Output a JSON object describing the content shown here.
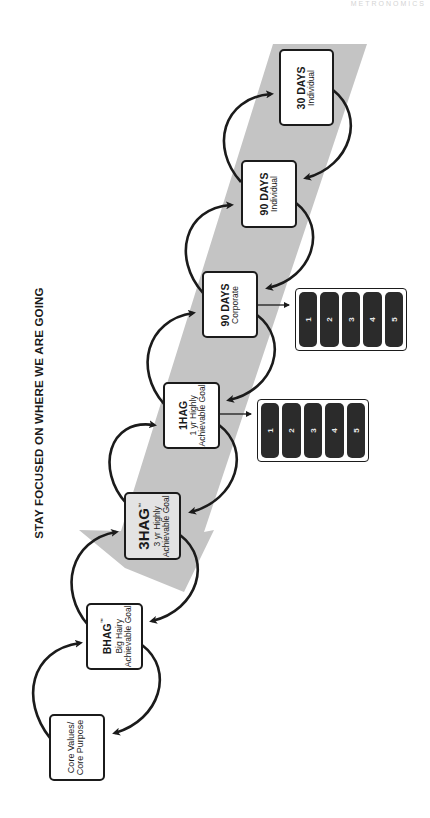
{
  "watermark": "METRONOMICS",
  "title": "STAY FOCUSED ON WHERE WE ARE GOING",
  "colors": {
    "background": "#ffffff",
    "arrow_band": "#c4c4c4",
    "box_border": "#1b1b1b",
    "shaded_box": "#e3e3e3",
    "priority_pill": "#2b2b2b"
  },
  "steps": [
    {
      "id": "30-days-individual",
      "title": "30 DAYS",
      "subtitle": "Individual"
    },
    {
      "id": "90-days-individual",
      "title": "90 DAYS",
      "subtitle": "Individual"
    },
    {
      "id": "90-days-corporate",
      "title": "90 DAYS",
      "subtitle": "Corporate"
    },
    {
      "id": "1hag",
      "title": "1HAG",
      "subtitle": "1 yr Highly",
      "subtitle2": "Achievable Goal"
    },
    {
      "id": "3hag",
      "title": "3HAG",
      "trademark": "™",
      "subtitle": "3 yr Highly",
      "subtitle2": "Achievable Goal"
    },
    {
      "id": "bhag",
      "title": "BHAG",
      "trademark": "™",
      "subtitle": "Big Hairy",
      "subtitle2": "Achievable Goal"
    },
    {
      "id": "core-values",
      "title": "Core Values/",
      "subtitle": "Core Purpose"
    }
  ],
  "priority_panels": [
    {
      "attached_to": "90-days-corporate",
      "items": [
        "1",
        "2",
        "3",
        "4",
        "5"
      ]
    },
    {
      "attached_to": "1hag",
      "items": [
        "1",
        "2",
        "3",
        "4",
        "5"
      ]
    }
  ]
}
